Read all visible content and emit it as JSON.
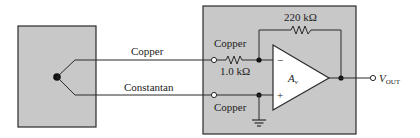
{
  "diagram": {
    "type": "thermocouple-amplifier-circuit",
    "labels": {
      "wire_top": "Copper",
      "wire_bottom": "Constantan",
      "terminal_top": "Copper",
      "terminal_bottom": "Copper",
      "input_resistor": "1.0 kΩ",
      "feedback_resistor": "220 kΩ",
      "opamp_gain": "A",
      "opamp_gain_sub": "v",
      "output": "V",
      "output_sub": "OUT",
      "inverting": "−",
      "noninverting": "+"
    },
    "colors": {
      "box_fill": "#c8c8c8",
      "line": "#2a2a2a",
      "opamp_fill": "#ffffff",
      "background": "#ffffff"
    }
  }
}
